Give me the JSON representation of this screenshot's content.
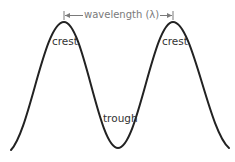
{
  "diagram": {
    "labels": {
      "crest_left": "crest",
      "crest_right": "crest",
      "trough": "trough",
      "wavelength": "wavelength (λ)"
    },
    "colors": {
      "wave": "#222222",
      "label": "#333333",
      "wavelength_marker": "#7a7a7a",
      "background": "#ffffff"
    }
  }
}
